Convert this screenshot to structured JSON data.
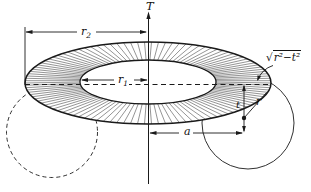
{
  "figure": {
    "background": "#ffffff",
    "ink": "#1a1a1a"
  },
  "labels": {
    "axis": "T",
    "outer_radius": {
      "base": "r",
      "sub": "2"
    },
    "inner_radius": {
      "base": "r",
      "sub": "1"
    },
    "center_distance": "a",
    "plane_offset": "t",
    "radius": "r",
    "half_chord": {
      "radical": "√",
      "radicand": "r²−t²"
    }
  }
}
